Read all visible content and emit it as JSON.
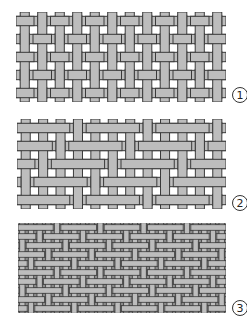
{
  "figure": {
    "colors": {
      "background": "#ffffff",
      "thread_fill": "#bdbdbd",
      "thread_outline": "#3a3a3a",
      "dense_background": "#8c8c8c"
    },
    "panels": [
      {
        "id": "1",
        "label": "1",
        "weave": "plain",
        "box": {
          "x": 16,
          "y": 12,
          "w": 210,
          "h": 90
        },
        "warp_count": 12,
        "weft_count": 5,
        "thread_ratio": 0.52,
        "float": 1,
        "shift": 1,
        "label_pos": {
          "x": 232,
          "y": 87
        }
      },
      {
        "id": "2",
        "label": "2",
        "weave": "twill",
        "box": {
          "x": 17,
          "y": 119,
          "w": 209,
          "h": 90
        },
        "warp_count": 12,
        "weft_count": 5,
        "thread_ratio": 0.52,
        "float": 3,
        "shift": 1,
        "label_pos": {
          "x": 232,
          "y": 195
        }
      },
      {
        "id": "3",
        "label": "3",
        "weave": "satin",
        "box": {
          "x": 18,
          "y": 223,
          "w": 208,
          "h": 90
        },
        "warp_count": 24,
        "weft_count": 10,
        "thread_ratio": 0.62,
        "float": 4,
        "shift": 2,
        "dense": true,
        "label_pos": {
          "x": 232,
          "y": 300
        }
      }
    ]
  }
}
